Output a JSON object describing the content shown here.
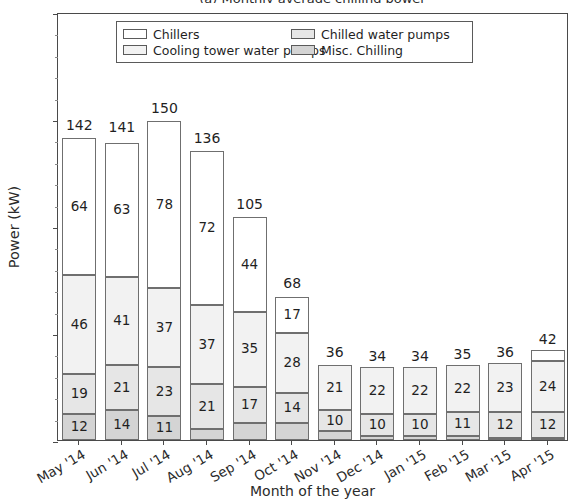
{
  "figure": {
    "clipped_title": "(a) Monthly average chilling power",
    "xlabel": "Month of the year",
    "ylabel": "Power (kW)"
  },
  "legend": {
    "items": [
      {
        "label": "Chillers",
        "swatch": "#ffffff"
      },
      {
        "label": "Chilled water pumps",
        "swatch": "#e6e6e6"
      },
      {
        "label": "Cooling tower water pumps",
        "swatch": "#f2f2f2"
      },
      {
        "label": "Misc. Chilling",
        "swatch": "#d4d4d4"
      }
    ]
  },
  "chart_data": {
    "type": "bar",
    "subtype": "stacked",
    "title": "(a) Monthly average chilling power",
    "xlabel": "Month of the year",
    "ylabel": "Power (kW)",
    "ylim": [
      0,
      200
    ],
    "yticks": [
      0,
      50,
      100,
      150,
      200
    ],
    "grid": false,
    "legend_position": "upper center",
    "categories": [
      "May '14",
      "Jun '14",
      "Jul '14",
      "Aug '14",
      "Sep '14",
      "Oct '14",
      "Nov '14",
      "Dec '14",
      "Jan '15",
      "Feb '15",
      "Mar '15",
      "Apr '15"
    ],
    "series": [
      {
        "name": "Misc. Chilling",
        "swatch": "#d4d4d4",
        "values": [
          12,
          14,
          11,
          5,
          8,
          8,
          4,
          2,
          2,
          2,
          1,
          1
        ],
        "labels": [
          "12",
          "14",
          "11",
          "",
          "",
          "",
          "",
          "",
          "",
          "",
          "",
          ""
        ]
      },
      {
        "name": "Chilled water pumps",
        "swatch": "#e6e6e6",
        "values": [
          19,
          21,
          23,
          21,
          17,
          14,
          10,
          10,
          10,
          11,
          12,
          12
        ],
        "labels": [
          "19",
          "21",
          "23",
          "21",
          "17",
          "14",
          "10",
          "10",
          "10",
          "11",
          "12",
          "12"
        ]
      },
      {
        "name": "Cooling tower water pumps",
        "swatch": "#f2f2f2",
        "values": [
          46,
          41,
          37,
          37,
          35,
          28,
          21,
          22,
          22,
          22,
          23,
          24
        ],
        "labels": [
          "46",
          "41",
          "37",
          "37",
          "35",
          "28",
          "21",
          "22",
          "22",
          "22",
          "23",
          "24"
        ]
      },
      {
        "name": "Chillers",
        "swatch": "#ffffff",
        "values": [
          64,
          63,
          78,
          72,
          44,
          17,
          0,
          0,
          0,
          0,
          0,
          5
        ],
        "labels": [
          "64",
          "63",
          "78",
          "72",
          "44",
          "17",
          "",
          "",
          "",
          "",
          "",
          ""
        ]
      }
    ],
    "totals": [
      142,
      141,
      150,
      136,
      105,
      68,
      36,
      34,
      34,
      35,
      36,
      42
    ],
    "total_labels": [
      "142",
      "141",
      "150",
      "136",
      "105",
      "68",
      "36",
      "34",
      "34",
      "35",
      "36",
      "42"
    ]
  }
}
